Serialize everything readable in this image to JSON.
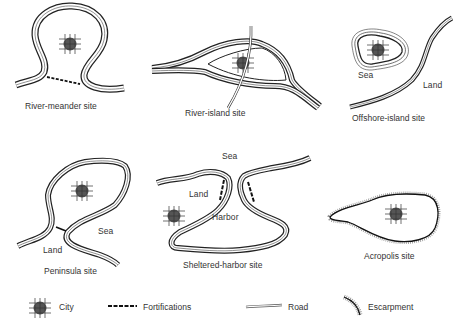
{
  "figure": {
    "panels": [
      {
        "id": "river-meander",
        "caption": "River-meander site",
        "labels": []
      },
      {
        "id": "river-island",
        "caption": "River-island site",
        "labels": []
      },
      {
        "id": "offshore-island",
        "caption": "Offshore-island site",
        "labels": [
          "Sea",
          "Land"
        ]
      },
      {
        "id": "peninsula",
        "caption": "Peninsula site",
        "labels": [
          "Sea",
          "Land"
        ]
      },
      {
        "id": "sheltered-harbor",
        "caption": "Sheltered-harbor site",
        "labels": [
          "Sea",
          "Land",
          "Harbor"
        ]
      },
      {
        "id": "acropolis",
        "caption": "Acropolis site",
        "labels": []
      }
    ],
    "legend": [
      {
        "symbol": "city-icon",
        "label": "City"
      },
      {
        "symbol": "fortifications-icon",
        "label": "Fortifications"
      },
      {
        "symbol": "road-icon",
        "label": "Road"
      },
      {
        "symbol": "escarpment-icon",
        "label": "Escarpment"
      }
    ]
  },
  "colors": {
    "line": "#222222",
    "city_fill": "#555555",
    "background": "#ffffff"
  }
}
